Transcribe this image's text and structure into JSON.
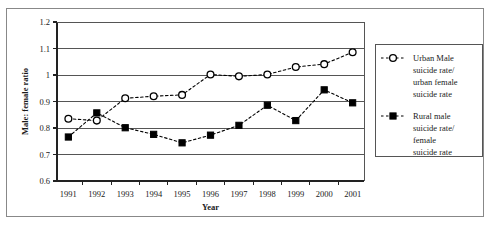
{
  "chart_data": {
    "type": "line",
    "title": "",
    "xlabel": "Year",
    "ylabel": "Male: female ratio",
    "x": [
      1991,
      1992,
      1993,
      1994,
      1995,
      1996,
      1997,
      1998,
      1999,
      2000,
      2001
    ],
    "xticklabels": [
      "1991",
      "1992",
      "1993",
      "1994",
      "1995",
      "1996",
      "1997",
      "1998",
      "1999",
      "2000",
      "2001"
    ],
    "yticklabels": [
      "0.6",
      "0.7",
      "0.8",
      "0.9",
      "1",
      "1.1",
      "1.2"
    ],
    "yticks": [
      0.6,
      0.7,
      0.8,
      0.9,
      1.0,
      1.1,
      1.2
    ],
    "xlim": [
      1990.6,
      2001.4
    ],
    "ylim": [
      0.6,
      1.2
    ],
    "grid": "horizontal",
    "legend_position": "right-outside",
    "series": [
      {
        "name": "Urban Male suicide rate/ urban female suicide rate",
        "marker": "open-circle",
        "linestyle": "dashed",
        "color": "#000000",
        "values": [
          0.835,
          0.828,
          0.912,
          0.92,
          0.925,
          1.002,
          0.995,
          1.002,
          1.03,
          1.041,
          1.086
        ]
      },
      {
        "name": "Rural male suicide rate/ female suicide rate",
        "marker": "filled-square",
        "linestyle": "dashed",
        "color": "#000000",
        "values": [
          0.766,
          0.857,
          0.801,
          0.776,
          0.744,
          0.773,
          0.81,
          0.886,
          0.828,
          0.944,
          0.895
        ]
      }
    ]
  },
  "legend": {
    "entries": [
      {
        "marker": "open-circle",
        "lines": [
          "Urban Male",
          "suicide rate/",
          "urban female",
          "suicide rate"
        ]
      },
      {
        "marker": "filled-square",
        "lines": [
          "Rural male",
          "suicide rate/",
          "female",
          "suicide rate"
        ]
      }
    ]
  }
}
